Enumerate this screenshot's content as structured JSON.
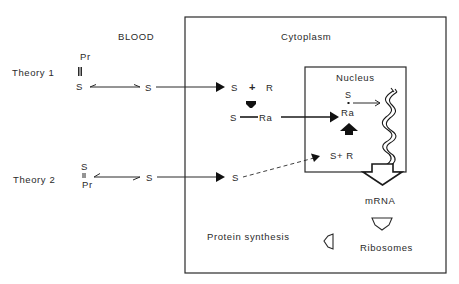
{
  "regions": {
    "blood_label": "BLOOD",
    "cytoplasm_label": "Cytoplasm",
    "nucleus_label": "Nucleus"
  },
  "theory1": {
    "label": "Theory 1",
    "bound_top": "Pr",
    "bound_bottom": "S",
    "bond": "triple",
    "free_steroid": "S",
    "cyto_s": "S",
    "cyto_plus": "+",
    "cyto_r": "R",
    "complex_s": "S",
    "complex_ra": "Ra",
    "nucleus_s": "S",
    "nucleus_ra": "Ra"
  },
  "theory2": {
    "label": "Theory 2",
    "bound_top": "S",
    "bound_bottom": "Pr",
    "bond": "double",
    "free_steroid": "S",
    "cyto_s": "S",
    "nucleus_sr": "S+ R"
  },
  "downstream": {
    "mrna": "mRNA",
    "ribosomes": "Ribosomes",
    "protein_synthesis": "Protein synthesis"
  },
  "colors": {
    "ink": "#2a2a2a",
    "background": "#ffffff"
  }
}
